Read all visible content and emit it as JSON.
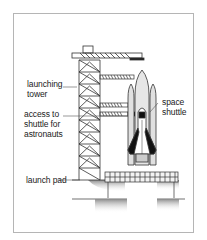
{
  "diagram": {
    "labels": {
      "launching_tower": "launching\ntower",
      "access": "access to\nshuttle for\nastronauts",
      "space_shuttle": "space\nshuttle",
      "launch_pad": "launch pad"
    },
    "colors": {
      "line": "#333333",
      "frame": "#b5b5b5",
      "shadow": "#9a9a9a"
    }
  }
}
